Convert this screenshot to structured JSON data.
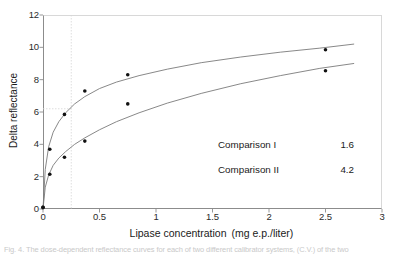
{
  "chart_data": {
    "type": "scatter",
    "title": "",
    "xlabel": "Lipase concentration",
    "xlabel_units": "(mg e.p./liter)",
    "ylabel": "Delta reflectance",
    "xlim": [
      0,
      3
    ],
    "ylim": [
      0,
      12
    ],
    "xticks": [
      "0",
      "0.5",
      "1",
      "1.5",
      "2",
      "2.5",
      "3"
    ],
    "xtick_values": [
      0,
      0.5,
      1,
      1.5,
      2,
      2.5,
      3
    ],
    "yticks": [
      "0",
      "2",
      "4",
      "6",
      "8",
      "10",
      "12"
    ],
    "ytick_values": [
      0,
      2,
      4,
      6,
      8,
      10,
      12
    ],
    "grid": false,
    "legend_position": "inside-lower-right",
    "series": [
      {
        "name": "Comparison I",
        "marker": "filled-circle",
        "color": "#111111",
        "curve_color": "#7a7a7a",
        "x": [
          0,
          0.06,
          0.19,
          0.37,
          0.75,
          2.5
        ],
        "y": [
          0.1,
          3.7,
          5.85,
          7.3,
          8.3,
          9.85
        ],
        "fit_curve": {
          "x": [
            0.0,
            0.02,
            0.05,
            0.09,
            0.14,
            0.2,
            0.28,
            0.37,
            0.5,
            0.65,
            0.85,
            1.1,
            1.4,
            1.75,
            2.1,
            2.45,
            2.75
          ],
          "y": [
            0.0,
            2.45,
            3.85,
            4.75,
            5.4,
            5.95,
            6.5,
            6.95,
            7.45,
            7.85,
            8.25,
            8.65,
            9.05,
            9.4,
            9.7,
            9.95,
            10.2
          ]
        }
      },
      {
        "name": "Comparison II",
        "marker": "filled-circle",
        "color": "#111111",
        "curve_color": "#7a7a7a",
        "x": [
          0,
          0.06,
          0.19,
          0.37,
          0.75,
          2.5
        ],
        "y": [
          0.1,
          2.15,
          3.2,
          4.2,
          6.5,
          8.55
        ],
        "fit_curve": {
          "x": [
            0.0,
            0.02,
            0.05,
            0.09,
            0.14,
            0.2,
            0.28,
            0.37,
            0.5,
            0.65,
            0.85,
            1.1,
            1.4,
            1.75,
            2.1,
            2.45,
            2.75
          ],
          "y": [
            0.0,
            1.35,
            2.1,
            2.7,
            3.15,
            3.55,
            4.0,
            4.4,
            4.9,
            5.4,
            5.95,
            6.55,
            7.15,
            7.75,
            8.25,
            8.7,
            9.0
          ]
        }
      }
    ],
    "reference_lines": [
      {
        "orientation": "vertical",
        "value": 0.25,
        "style": "dotted",
        "color": "#d5d5d5"
      },
      {
        "orientation": "horizontal",
        "value": 6.2,
        "style": "dotted",
        "color": "#d5d5d5"
      }
    ],
    "annotations": [
      {
        "label": "Comparison I",
        "value": "1.6"
      },
      {
        "label": "Comparison II",
        "value": "4.2"
      }
    ]
  },
  "caption": {
    "text": "Fig. 4. The dose-dependent reflectance curves for each of two different calibrator systems, (C.V.) of the two"
  }
}
